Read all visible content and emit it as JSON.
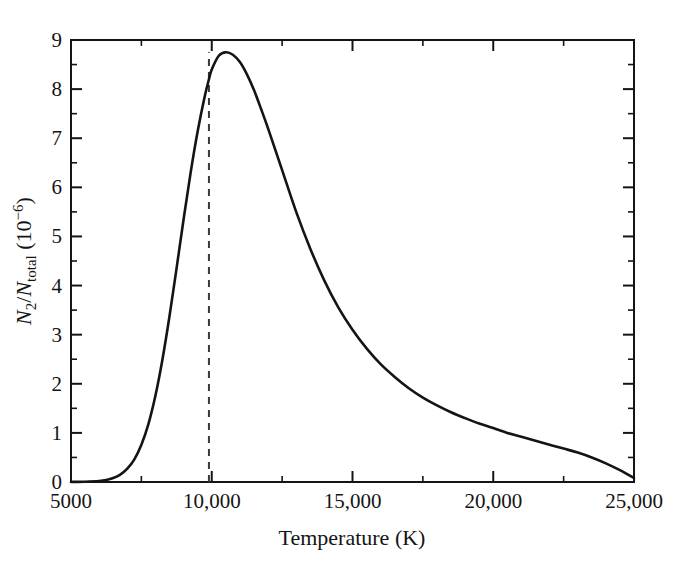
{
  "figure": {
    "background_color": "#ffffff",
    "ink_color": "#141414",
    "curve_color": "#141414",
    "marker_color": "#3a3a3a"
  },
  "chart_data": {
    "type": "line",
    "title": "",
    "xlabel": "Temperature (K)",
    "ylabel": "N2/Ntotal (10^-6)",
    "ylabel_parts": {
      "numerator": "N",
      "numerator_sub": "2",
      "denominator": "N",
      "denominator_sub": "total",
      "units_open": " (10",
      "units_exponent": "−6",
      "units_close": ")"
    },
    "xlim": [
      5000,
      25000
    ],
    "ylim": [
      0,
      9
    ],
    "grid": false,
    "legend": null,
    "xticks": [
      5000,
      10000,
      15000,
      20000,
      25000
    ],
    "xtick_labels": [
      "5000",
      "10,000",
      "15,000",
      "20,000",
      "25,000"
    ],
    "xticks_minor": [
      7500,
      12500,
      17500,
      22500
    ],
    "yticks": [
      0,
      1,
      2,
      3,
      4,
      5,
      6,
      7,
      8,
      9
    ],
    "ytick_labels": [
      "0",
      "1",
      "2",
      "3",
      "4",
      "5",
      "6",
      "7",
      "8",
      "9"
    ],
    "yticks_minor": [
      0.5,
      1.5,
      2.5,
      3.5,
      4.5,
      5.5,
      6.5,
      7.5,
      8.5
    ],
    "annotations": [
      {
        "name": "peak-dashed-line",
        "type": "vline",
        "x": 9900,
        "y_from": 0,
        "y_to": 8.75,
        "style": "dashed",
        "label": ""
      }
    ],
    "peak": {
      "x": 9900,
      "y": 8.75
    },
    "x": [
      5000,
      5500,
      6000,
      6250,
      6500,
      6750,
      7000,
      7250,
      7500,
      7750,
      8000,
      8250,
      8500,
      8750,
      9000,
      9250,
      9500,
      9750,
      9900,
      10000,
      10250,
      10500,
      10750,
      11000,
      11250,
      11500,
      11750,
      12000,
      12500,
      13000,
      13500,
      14000,
      14500,
      15000,
      15500,
      16000,
      16500,
      17000,
      17500,
      18000,
      18500,
      19000,
      19500,
      20000,
      20500,
      21000,
      21500,
      22000,
      22500,
      23000,
      23500,
      24000,
      24500,
      25000
    ],
    "y": [
      0.002,
      0.006,
      0.02,
      0.04,
      0.08,
      0.15,
      0.27,
      0.46,
      0.76,
      1.18,
      1.76,
      2.5,
      3.38,
      4.35,
      5.35,
      6.3,
      7.14,
      7.85,
      8.2,
      8.4,
      8.68,
      8.75,
      8.7,
      8.55,
      8.3,
      7.98,
      7.6,
      7.2,
      6.35,
      5.5,
      4.75,
      4.1,
      3.55,
      3.1,
      2.72,
      2.4,
      2.14,
      1.91,
      1.72,
      1.56,
      1.42,
      1.3,
      1.19,
      1.1,
      1.0,
      0.92,
      0.84,
      0.76,
      0.68,
      0.6,
      0.5,
      0.38,
      0.24,
      0.08
    ]
  },
  "axes_geometry": {
    "left_px": 71,
    "right_px": 634,
    "top_px": 40,
    "bottom_px": 482
  }
}
